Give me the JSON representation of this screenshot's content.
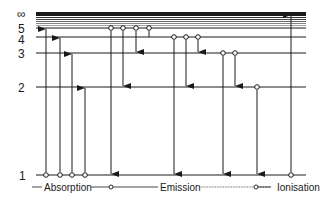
{
  "diagram": {
    "type": "energy-level-diagram",
    "ink_color": "#1a1a1a",
    "levels": [
      {
        "n": "∞",
        "y": 14
      },
      {
        "n": "5",
        "y": 28
      },
      {
        "n": "4",
        "y": 37
      },
      {
        "n": "3",
        "y": 53
      },
      {
        "n": "2",
        "y": 87
      },
      {
        "n": "1",
        "y": 175
      }
    ],
    "level_labels": {
      "inf": "∞",
      "n5": "5",
      "n4": "4",
      "n3": "3",
      "n2": "2",
      "n1": "1"
    },
    "absorption_transitions": [
      {
        "x": 46,
        "from": "1",
        "to": "5"
      },
      {
        "x": 60,
        "from": "1",
        "to": "4"
      },
      {
        "x": 72,
        "from": "1",
        "to": "3"
      },
      {
        "x": 85,
        "from": "1",
        "to": "2"
      }
    ],
    "emission_transitions": [
      {
        "x": 111,
        "from": "5",
        "to": "1"
      },
      {
        "x": 123,
        "from": "5",
        "to": "2"
      },
      {
        "x": 136,
        "from": "5",
        "to": "3"
      },
      {
        "x": 149,
        "from": "5",
        "to": "4"
      },
      {
        "x": 174,
        "from": "4",
        "to": "1"
      },
      {
        "x": 186,
        "from": "4",
        "to": "2"
      },
      {
        "x": 198,
        "from": "4",
        "to": "3"
      },
      {
        "x": 223,
        "from": "3",
        "to": "1"
      },
      {
        "x": 235,
        "from": "3",
        "to": "2"
      },
      {
        "x": 257,
        "from": "2",
        "to": "1"
      }
    ],
    "ionisation_transition": {
      "x": 291,
      "from": "1",
      "to": "∞"
    },
    "legend": {
      "absorption": "Absorption",
      "emission": "Emission",
      "ionisation": "Ionisation"
    }
  }
}
